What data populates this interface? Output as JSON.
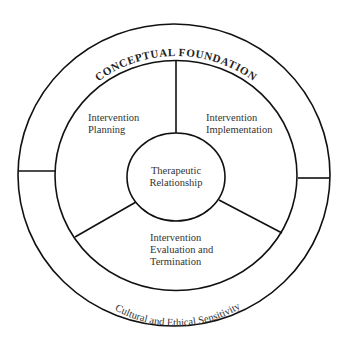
{
  "diagram": {
    "outer_ring": {
      "top_label": "CONCEPTUAL FOUNDATION",
      "bottom_label": "Cultural and Ethical Sensitivity"
    },
    "segments": [
      {
        "line1": "Intervention",
        "line2": "Planning"
      },
      {
        "line1": "Intervention",
        "line2": "Implementation"
      },
      {
        "line1": "Intervention",
        "line2": "Evaluation and",
        "line3": "Termination"
      }
    ],
    "center": {
      "line1": "Therapeutic",
      "line2": "Relationship"
    },
    "colors": {
      "stroke": "#111111",
      "text": "#333333",
      "background": "#ffffff"
    }
  }
}
